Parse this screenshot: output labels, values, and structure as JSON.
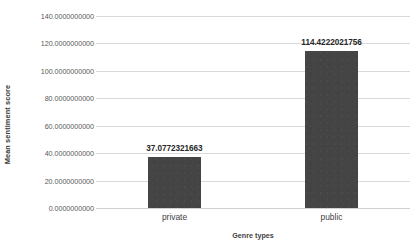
{
  "chart_data": {
    "type": "bar",
    "title": "",
    "subtitle": "",
    "xlabel": "Genre types",
    "ylabel": "Mean sentiment score",
    "categories": [
      "private",
      "public"
    ],
    "values": [
      37.0772321663,
      114.4222021756
    ],
    "value_labels": [
      "37.0772321663",
      "114.4222021756"
    ],
    "series": [
      {
        "name": "Mean sentiment score",
        "values": [
          37.0772321663,
          114.4222021756
        ],
        "color": "#444444"
      }
    ],
    "ylim": [
      0,
      140
    ],
    "ytick_values": [
      0,
      20,
      40,
      60,
      80,
      100,
      120,
      140
    ],
    "ytick_labels": [
      "0.0000000000",
      "20.0000000000",
      "40.0000000000",
      "60.0000000000",
      "80.0000000000",
      "100.0000000000",
      "120.0000000000",
      "140.0000000000"
    ],
    "grid": "horizontal",
    "grid_color": "#d9d9d9",
    "legend": "none",
    "legend_position": "none",
    "background": "#ffffff",
    "bar_color": "#444444"
  }
}
